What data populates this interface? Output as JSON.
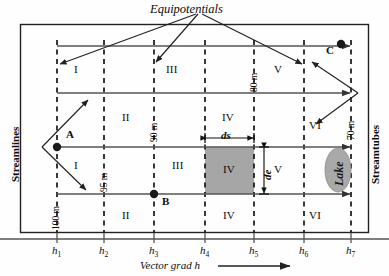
{
  "figure": {
    "title": "Equipotentials",
    "left_axis_label": "Streamlines",
    "right_axis_label": "Streamtubes",
    "bottom_axis_label": "Vector grad h",
    "lake_label": "Lake",
    "colors": {
      "shaded_cell": "#a6a6a6",
      "lake_fill": "#a9a9a9",
      "line": "#4d4d4d",
      "dashed": "#1a1a1a",
      "border": "#222222",
      "text": "#0b0b0b"
    }
  },
  "equipotentials": {
    "ticks": [
      {
        "id": "h1",
        "label": "h",
        "sub": "1",
        "x": 57
      },
      {
        "id": "h2",
        "label": "h",
        "sub": "2",
        "x": 104
      },
      {
        "id": "h3",
        "label": "h",
        "sub": "3",
        "x": 154
      },
      {
        "id": "h4",
        "label": "h",
        "sub": "4",
        "x": 205
      },
      {
        "id": "h5",
        "label": "h",
        "sub": "5",
        "x": 254
      },
      {
        "id": "h6",
        "label": "h",
        "sub": "6",
        "x": 304
      },
      {
        "id": "h7",
        "label": "h",
        "sub": "7",
        "x": 351
      }
    ]
  },
  "head_values": [
    {
      "value": "100 m",
      "at": "h1"
    },
    {
      "value": "95 m",
      "at": "h2"
    },
    {
      "value": "90 m",
      "at": "h3"
    },
    {
      "value": "80 m",
      "at": "h5"
    },
    {
      "value": "70 m",
      "at": "h7"
    }
  ],
  "streamlines": [
    {
      "id": "streamline-1",
      "y": 46
    },
    {
      "id": "streamline-2",
      "y": 93
    },
    {
      "id": "streamline-3",
      "y": 147
    },
    {
      "id": "streamline-4",
      "y": 194
    }
  ],
  "regions": [
    {
      "label": "I",
      "x": 78,
      "y": 70
    },
    {
      "label": "III",
      "x": 172,
      "y": 70
    },
    {
      "label": "V",
      "x": 277,
      "y": 70
    },
    {
      "label": "II",
      "x": 126,
      "y": 118
    },
    {
      "label": "IV",
      "x": 227,
      "y": 118
    },
    {
      "label": "VI",
      "x": 313,
      "y": 126
    },
    {
      "label": "I",
      "x": 78,
      "y": 166
    },
    {
      "label": "III",
      "x": 177,
      "y": 166
    },
    {
      "label": "IV",
      "x": 227,
      "y": 170
    },
    {
      "label": "V",
      "x": 277,
      "y": 170
    },
    {
      "label": "II",
      "x": 126,
      "y": 216
    },
    {
      "label": "IV",
      "x": 227,
      "y": 216
    },
    {
      "label": "VI",
      "x": 313,
      "y": 216
    }
  ],
  "points": [
    {
      "name": "A",
      "x": 57,
      "y": 147,
      "label_dx": 8,
      "label_dy": -12
    },
    {
      "name": "B",
      "x": 154,
      "y": 194,
      "label_dx": 7,
      "label_dy": 2
    },
    {
      "name": "C",
      "x": 340,
      "y": 46,
      "label_dx": -16,
      "label_dy": 3
    }
  ],
  "dimensions": {
    "ds_label": "ds",
    "de_label": "de",
    "cell": {
      "x0": 205,
      "x1": 254,
      "y0": 147,
      "y1": 194
    }
  }
}
